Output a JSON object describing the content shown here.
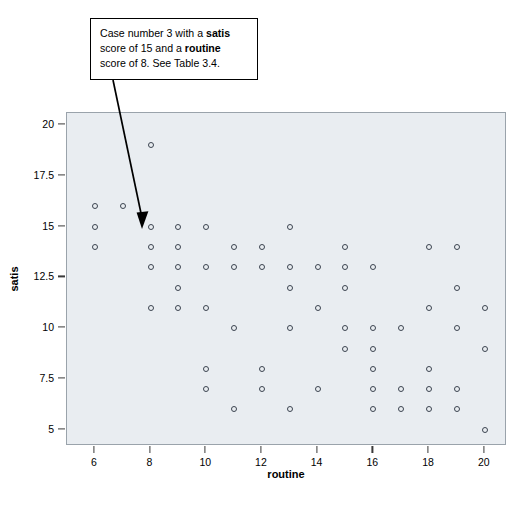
{
  "callout": {
    "text_part1": "Case number 3 with a ",
    "bold1": "satis",
    "text_part2": " score of 15 and a ",
    "bold2": "routine",
    "text_part3": " score of 8. See Table 3.4."
  },
  "colors": {
    "plot_background": "#e9edf1",
    "plot_border": "#9aa3ab",
    "marker_stroke": "#3c4450",
    "annotation_border": "#000000",
    "text": "#000000"
  },
  "chart_data": {
    "type": "scatter",
    "title": "",
    "xlabel": "routine",
    "ylabel": "satis",
    "xlim": [
      5,
      20.8
    ],
    "ylim": [
      4.2,
      20.6
    ],
    "xticks": [
      6,
      8,
      10,
      12,
      14,
      16,
      18,
      20
    ],
    "xtick_labels": [
      "6",
      "8",
      "10",
      "12",
      "14",
      "16",
      "18",
      "20"
    ],
    "yticks": [
      5,
      7.5,
      10,
      12.5,
      15,
      17.5,
      20
    ],
    "ytick_labels": [
      "5",
      "7.5",
      "10",
      "12.5",
      "15",
      "17.5",
      "20"
    ],
    "grid": false,
    "legend": null,
    "marker": "open-circle",
    "points": [
      {
        "x": 6,
        "y": 16
      },
      {
        "x": 6,
        "y": 15
      },
      {
        "x": 6,
        "y": 14
      },
      {
        "x": 7,
        "y": 16
      },
      {
        "x": 8,
        "y": 19
      },
      {
        "x": 8,
        "y": 15
      },
      {
        "x": 8,
        "y": 14
      },
      {
        "x": 8,
        "y": 13
      },
      {
        "x": 8,
        "y": 11
      },
      {
        "x": 9,
        "y": 15
      },
      {
        "x": 9,
        "y": 14
      },
      {
        "x": 9,
        "y": 13
      },
      {
        "x": 9,
        "y": 12
      },
      {
        "x": 9,
        "y": 11
      },
      {
        "x": 10,
        "y": 15
      },
      {
        "x": 10,
        "y": 13
      },
      {
        "x": 10,
        "y": 11
      },
      {
        "x": 10,
        "y": 8
      },
      {
        "x": 10,
        "y": 7
      },
      {
        "x": 11,
        "y": 14
      },
      {
        "x": 11,
        "y": 13
      },
      {
        "x": 11,
        "y": 10
      },
      {
        "x": 11,
        "y": 6
      },
      {
        "x": 12,
        "y": 14
      },
      {
        "x": 12,
        "y": 13
      },
      {
        "x": 12,
        "y": 8
      },
      {
        "x": 12,
        "y": 7
      },
      {
        "x": 13,
        "y": 15
      },
      {
        "x": 13,
        "y": 13
      },
      {
        "x": 13,
        "y": 12
      },
      {
        "x": 13,
        "y": 10
      },
      {
        "x": 13,
        "y": 6
      },
      {
        "x": 14,
        "y": 13
      },
      {
        "x": 14,
        "y": 11
      },
      {
        "x": 14,
        "y": 7
      },
      {
        "x": 15,
        "y": 14
      },
      {
        "x": 15,
        "y": 13
      },
      {
        "x": 15,
        "y": 12
      },
      {
        "x": 15,
        "y": 10
      },
      {
        "x": 15,
        "y": 9
      },
      {
        "x": 16,
        "y": 13
      },
      {
        "x": 16,
        "y": 10
      },
      {
        "x": 16,
        "y": 9
      },
      {
        "x": 16,
        "y": 8
      },
      {
        "x": 16,
        "y": 7
      },
      {
        "x": 16,
        "y": 6
      },
      {
        "x": 17,
        "y": 10
      },
      {
        "x": 17,
        "y": 7
      },
      {
        "x": 17,
        "y": 6
      },
      {
        "x": 18,
        "y": 14
      },
      {
        "x": 18,
        "y": 11
      },
      {
        "x": 18,
        "y": 8
      },
      {
        "x": 18,
        "y": 7
      },
      {
        "x": 18,
        "y": 6
      },
      {
        "x": 19,
        "y": 14
      },
      {
        "x": 19,
        "y": 12
      },
      {
        "x": 19,
        "y": 10
      },
      {
        "x": 19,
        "y": 7
      },
      {
        "x": 19,
        "y": 6
      },
      {
        "x": 20,
        "y": 11
      },
      {
        "x": 20,
        "y": 9
      },
      {
        "x": 20,
        "y": 5
      }
    ],
    "annotations": [
      {
        "text": "Case number 3 with a satis score of 15 and a routine score of 8. See Table 3.4.",
        "points_to": {
          "x": 8,
          "y": 15
        }
      }
    ]
  }
}
